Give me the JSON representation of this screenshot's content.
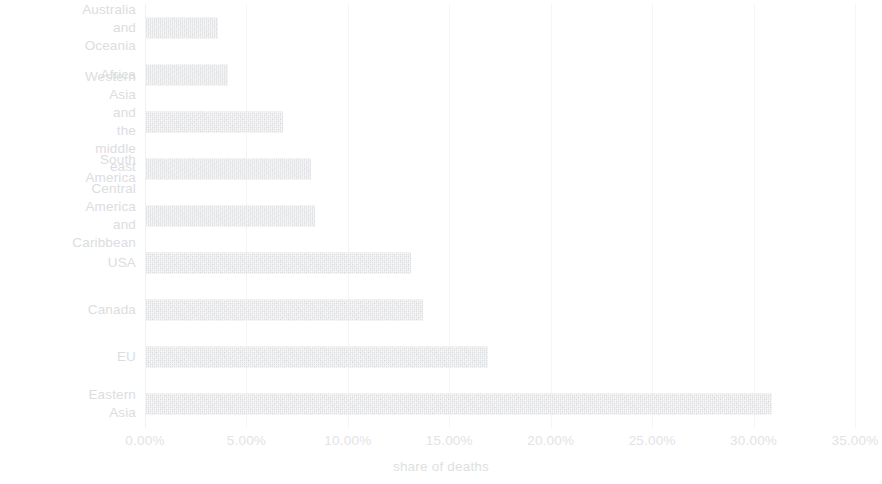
{
  "chart_data": {
    "type": "bar",
    "orientation": "horizontal",
    "title": "",
    "xlabel": "share of deaths",
    "ylabel": "",
    "categories": [
      "Australia\nand Oceania",
      "Africa",
      "Western Asia and\nthe middle east",
      "South America",
      "Central America\nand Caribbean",
      "USA",
      "Canada",
      "EU",
      "Eastern Asia"
    ],
    "values": [
      3.6,
      4.1,
      6.8,
      8.2,
      8.4,
      13.1,
      13.7,
      16.9,
      30.9
    ],
    "value_unit": "%",
    "xlim": [
      0,
      35
    ],
    "xticks": [
      0,
      5,
      10,
      15,
      20,
      25,
      30,
      35
    ],
    "xtick_labels": [
      "0.00%",
      "5.00%",
      "10.00%",
      "15.00%",
      "20.00%",
      "25.00%",
      "30.00%",
      "35.00%"
    ],
    "grid": "vertical",
    "legend": "none",
    "bar_color": "#e3e4e6",
    "text_color": "#dcdddf",
    "gridline_color": "#f4f5f6",
    "background_color": "#ffffff"
  }
}
